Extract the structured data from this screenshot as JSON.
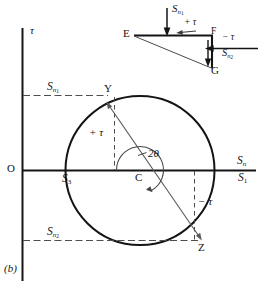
{
  "figure": {
    "caption": "(b)",
    "type": "mohr-circle-stress-diagram"
  },
  "axes": {
    "vertical_axis_label": "τ",
    "horizontal_axis_label_main": "S",
    "horizontal_axis_label_sub": "n",
    "origin_label": "O"
  },
  "circle": {
    "center_label": "C",
    "point_y_label": "Y",
    "point_z_label": "Z",
    "angle_label_number": "2",
    "angle_label_theta": "θ",
    "tau_positive_label": "+ τ",
    "tau_negative_label": "− τ",
    "intercept_left_main": "S",
    "intercept_left_sub": "3",
    "intercept_right_main": "S",
    "intercept_right_sub": "1"
  },
  "normal_stress_lines": {
    "upper_main": "S",
    "upper_sub": "n",
    "upper_sub_index": "1",
    "lower_main": "S",
    "lower_sub": "n",
    "lower_sub_index": "2"
  },
  "element": {
    "vertex_e": "E",
    "vertex_f": "F",
    "vertex_g": "G",
    "top_force_main": "S",
    "top_force_sub": "n",
    "top_force_sub_index": "1",
    "top_shear_label": "+ τ",
    "right_shear_label": "− τ",
    "right_force_main": "S",
    "right_force_sub": "n",
    "right_force_sub_index": "2"
  },
  "colors": {
    "ink": "#141414",
    "line": "#1a1a1a",
    "dashed": "#555555",
    "background": "#ffffff"
  }
}
